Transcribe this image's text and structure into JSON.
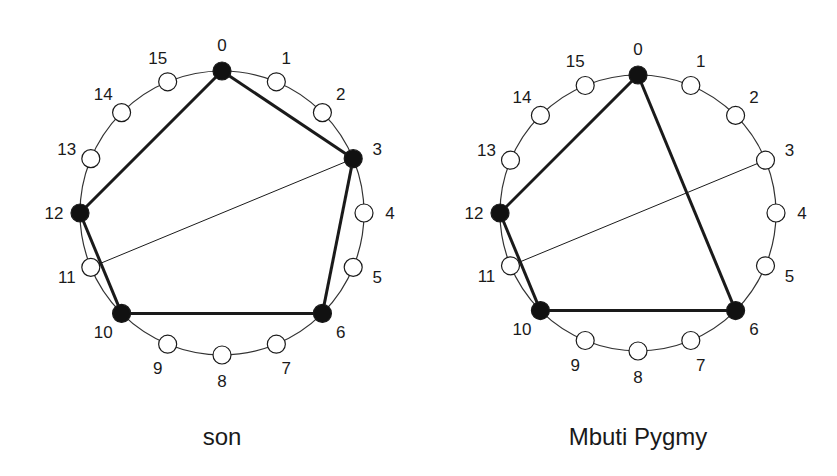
{
  "diagrams": [
    {
      "caption": "son",
      "center": [
        222,
        213
      ],
      "radius": 142,
      "node_count": 16,
      "filled_nodes": [
        0,
        3,
        6,
        10,
        12
      ],
      "thick_edges": [
        [
          0,
          3
        ],
        [
          3,
          6
        ],
        [
          6,
          10
        ],
        [
          10,
          12
        ],
        [
          12,
          0
        ]
      ],
      "thin_edges": [
        [
          3,
          11
        ]
      ],
      "labels": [
        "0",
        "1",
        "2",
        "3",
        "4",
        "5",
        "6",
        "7",
        "8",
        "9",
        "10",
        "11",
        "12",
        "13",
        "14",
        "15"
      ]
    },
    {
      "caption": "Mbuti Pygmy",
      "center": [
        638,
        213
      ],
      "radius": 138,
      "node_count": 16,
      "filled_nodes": [
        0,
        6,
        10,
        12
      ],
      "thick_edges": [
        [
          0,
          6
        ],
        [
          6,
          10
        ],
        [
          10,
          12
        ],
        [
          12,
          0
        ]
      ],
      "thin_edges": [
        [
          3,
          11
        ]
      ],
      "labels": [
        "0",
        "1",
        "2",
        "3",
        "4",
        "5",
        "6",
        "7",
        "8",
        "9",
        "10",
        "11",
        "12",
        "13",
        "14",
        "15"
      ]
    }
  ],
  "colors": {
    "stroke": "#1a1a1a",
    "filled": "#111111",
    "empty": "#ffffff",
    "circle": "#333333"
  }
}
